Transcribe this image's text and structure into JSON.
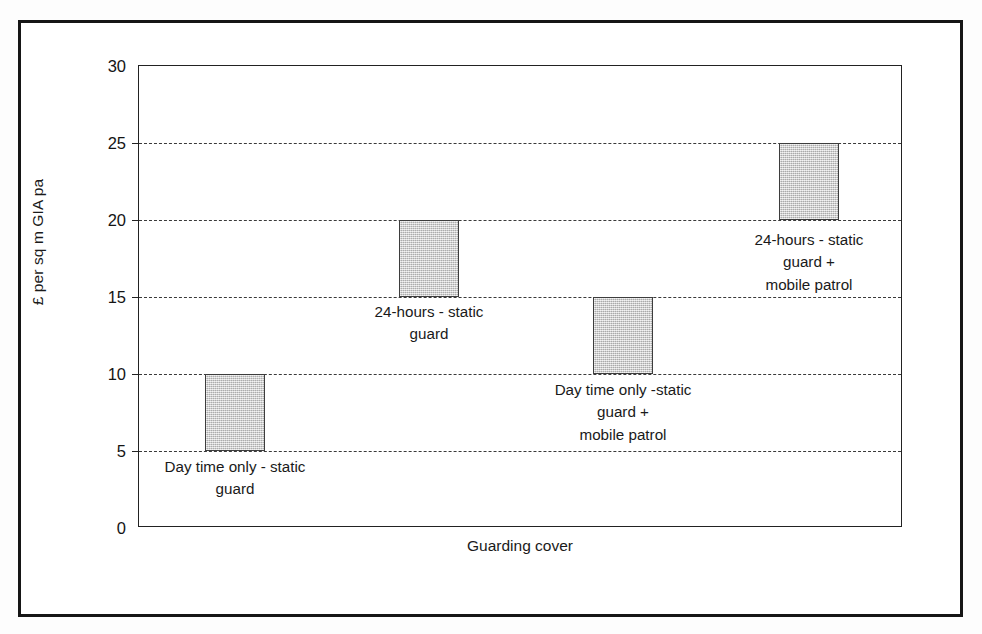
{
  "chart_data": {
    "type": "bar",
    "subtype": "floating-range-bar",
    "title": "",
    "xlabel": "Guarding cover",
    "ylabel": "£ per sq m GIA pa",
    "ylim": [
      0,
      30
    ],
    "ytick_values": [
      0,
      5,
      10,
      15,
      20,
      25,
      30
    ],
    "ytick_labels": [
      "0",
      "5",
      "10",
      "15",
      "20",
      "25",
      "30"
    ],
    "ytick_interval": 5,
    "gridlines": {
      "visible": true,
      "axis": "y",
      "style": "dashed",
      "at_values": [
        5,
        10,
        15,
        20,
        25
      ]
    },
    "legend": {
      "visible": false
    },
    "categories": [
      "Day time only - static guard",
      "24-hours - static guard",
      "Day time only -static guard + mobile patrol",
      "24-hours - static guard + mobile patrol"
    ],
    "bars": [
      {
        "category": "Day time only - static guard",
        "label": "Day time only - static\nguard",
        "low": 5,
        "high": 10,
        "label_position": "below"
      },
      {
        "category": "24-hours - static guard",
        "label": "24-hours - static\nguard",
        "low": 15,
        "high": 20,
        "label_position": "below"
      },
      {
        "category": "Day time only -static guard + mobile patrol",
        "label": "Day time only -static\nguard +\nmobile patrol",
        "low": 10,
        "high": 15,
        "label_position": "below"
      },
      {
        "category": "24-hours - static guard + mobile patrol",
        "label": "24-hours - static\nguard +\nmobile patrol",
        "low": 20,
        "high": 25,
        "label_position": "below"
      }
    ],
    "colors": {
      "bar_fill": "#cbcbcb",
      "bar_border": "#3d3d3d",
      "gridline": "#3a3a3a",
      "axis": "#222222",
      "frame": "#161616",
      "text": "#1a1a1a",
      "background": "#ffffff"
    }
  },
  "geometry": {
    "plot": {
      "left": 138,
      "top": 65,
      "width": 764,
      "height": 462
    },
    "y_pixel_at_zero": 462,
    "pixels_per_unit": 15.3,
    "bar_width": 60,
    "bar_centers_x": [
      234,
      428,
      622,
      808
    ],
    "label_tops": [
      455,
      300,
      378,
      228
    ]
  }
}
